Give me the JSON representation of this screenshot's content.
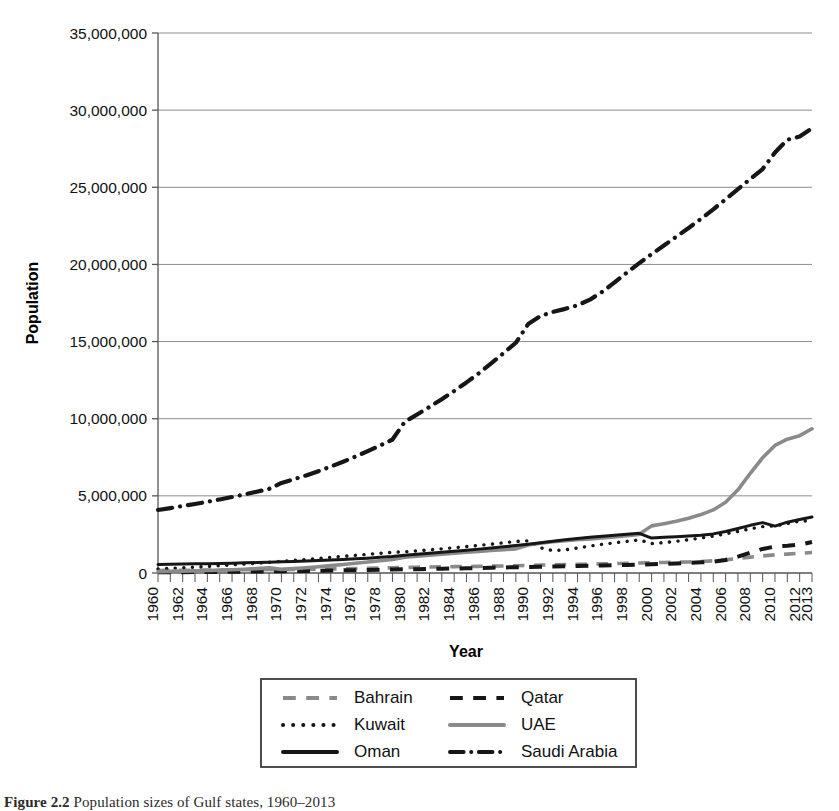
{
  "figure": {
    "caption_prefix": "Figure 2.2",
    "caption_text": "Population sizes of Gulf states, 1960–2013"
  },
  "axes": {
    "y_title": "Population",
    "x_title": "Year",
    "y_ticks": [
      "0",
      "5,000,000",
      "10,000,000",
      "15,000,000",
      "20,000,000",
      "25,000,000",
      "30,000,000",
      "35,000,000"
    ],
    "x_ticks": [
      "1960",
      "1962",
      "1964",
      "1966",
      "1968",
      "1970",
      "1972",
      "1974",
      "1976",
      "1978",
      "1980",
      "1982",
      "1984",
      "1986",
      "1988",
      "1990",
      "1992",
      "1994",
      "1996",
      "1998",
      "2000",
      "2002",
      "2004",
      "2006",
      "2008",
      "2010",
      "2012",
      "2013"
    ]
  },
  "legend": {
    "entries": [
      {
        "label": "Bahrain",
        "style": "dashed",
        "color": "#8a8a8a",
        "col": 0,
        "row": 0
      },
      {
        "label": "Qatar",
        "style": "dashed",
        "color": "#161616",
        "col": 1,
        "row": 0
      },
      {
        "label": "Kuwait",
        "style": "dotted",
        "color": "#161616",
        "col": 0,
        "row": 1
      },
      {
        "label": "UAE",
        "style": "solid",
        "color": "#8a8a8a",
        "col": 1,
        "row": 1
      },
      {
        "label": "Oman",
        "style": "solid",
        "color": "#161616",
        "col": 0,
        "row": 2
      },
      {
        "label": "Saudi Arabia",
        "style": "dashdot",
        "color": "#161616",
        "col": 1,
        "row": 2
      }
    ]
  },
  "chart_data": {
    "type": "line",
    "title": "",
    "xlabel": "Year",
    "ylabel": "Population",
    "xlim": [
      1960,
      2013
    ],
    "ylim": [
      0,
      35000000
    ],
    "grid": true,
    "legend_position": "bottom",
    "x": [
      1960,
      1961,
      1962,
      1963,
      1964,
      1965,
      1966,
      1967,
      1968,
      1969,
      1970,
      1971,
      1972,
      1973,
      1974,
      1975,
      1976,
      1977,
      1978,
      1979,
      1980,
      1981,
      1982,
      1983,
      1984,
      1985,
      1986,
      1987,
      1988,
      1989,
      1990,
      1991,
      1992,
      1993,
      1994,
      1995,
      1996,
      1997,
      1998,
      1999,
      2000,
      2001,
      2002,
      2003,
      2004,
      2005,
      2006,
      2007,
      2008,
      2009,
      2010,
      2011,
      2012,
      2013
    ],
    "series": [
      {
        "name": "Bahrain",
        "style": "dashed",
        "color": "#8a8a8a",
        "values": [
          162000,
          168000,
          174000,
          181000,
          187000,
          194000,
          201000,
          208000,
          215000,
          222000,
          220000,
          228000,
          238000,
          250000,
          263000,
          277000,
          292000,
          307000,
          322000,
          337000,
          358000,
          375000,
          390000,
          402000,
          412000,
          422000,
          432000,
          444000,
          457000,
          471000,
          493000,
          514000,
          530000,
          544000,
          558000,
          574000,
          592000,
          611000,
          630000,
          650000,
          666000,
          682000,
          699000,
          716000,
          744000,
          788000,
          853000,
          937000,
          1030000,
          1106000,
          1175000,
          1226000,
          1277000,
          1332000
        ]
      },
      {
        "name": "Qatar",
        "style": "dashed",
        "color": "#161616",
        "values": [
          47000,
          51000,
          56000,
          61000,
          67000,
          74000,
          82000,
          90000,
          98000,
          106000,
          112000,
          119000,
          129000,
          142000,
          156000,
          170000,
          184000,
          198000,
          212000,
          226000,
          238000,
          249000,
          262000,
          276000,
          292000,
          308000,
          325000,
          343000,
          361000,
          377000,
          391000,
          404000,
          418000,
          433000,
          449000,
          466000,
          483000,
          502000,
          522000,
          543000,
          566000,
          592000,
          622000,
          655000,
          691000,
          736000,
          846000,
          1065000,
          1314000,
          1560000,
          1715000,
          1765000,
          1833000,
          2004000
        ]
      },
      {
        "name": "Kuwait",
        "style": "dotted",
        "color": "#161616",
        "values": [
          269000,
          302000,
          339000,
          381000,
          427000,
          477000,
          529000,
          583000,
          639000,
          697000,
          756000,
          817000,
          880000,
          946000,
          1013000,
          1080000,
          1146000,
          1212000,
          1277000,
          1340000,
          1377000,
          1436000,
          1502000,
          1570000,
          1640000,
          1712000,
          1788000,
          1869000,
          1956000,
          2047000,
          2088000,
          1631000,
          1451000,
          1503000,
          1621000,
          1745000,
          1859000,
          1959000,
          2051000,
          2144000,
          1906000,
          1972000,
          2052000,
          2154000,
          2264000,
          2394000,
          2538000,
          2698000,
          2860000,
          3006000,
          3051000,
          3201000,
          3368000,
          3369000
        ]
      },
      {
        "name": "UAE",
        "style": "solid",
        "color": "#8a8a8a",
        "values": [
          92000,
          105000,
          120000,
          138000,
          159000,
          184000,
          213000,
          246000,
          286000,
          331000,
          235000,
          285000,
          342000,
          406000,
          477000,
          548000,
          629000,
          712000,
          795000,
          878000,
          1016000,
          1089000,
          1159000,
          1224000,
          1283000,
          1342000,
          1399000,
          1454000,
          1508000,
          1562000,
          1809000,
          1930000,
          2023000,
          2094000,
          2155000,
          2213000,
          2275000,
          2343000,
          2419000,
          2506000,
          3055000,
          3195000,
          3355000,
          3549000,
          3785000,
          4089000,
          4588000,
          5390000,
          6464000,
          7472000,
          8270000,
          8672000,
          8900000,
          9346000
        ]
      },
      {
        "name": "Oman",
        "style": "solid",
        "color": "#161616",
        "values": [
          551000,
          564000,
          578000,
          592000,
          607000,
          623000,
          639000,
          657000,
          676000,
          696000,
          724000,
          748000,
          774000,
          803000,
          836000,
          874000,
          917000,
          964000,
          1013000,
          1063000,
          1154000,
          1216000,
          1280000,
          1345000,
          1410000,
          1477000,
          1547000,
          1620000,
          1697000,
          1777000,
          1868000,
          1962000,
          2058000,
          2152000,
          2239000,
          2318000,
          2389000,
          2453000,
          2513000,
          2572000,
          2264000,
          2310000,
          2356000,
          2402000,
          2450000,
          2534000,
          2690000,
          2886000,
          3090000,
          3266000,
          3041000,
          3295000,
          3463000,
          3632000
        ]
      },
      {
        "name": "Saudi Arabia",
        "style": "dashdot",
        "color": "#161616",
        "values": [
          4086000,
          4209000,
          4338000,
          4474000,
          4617000,
          4767000,
          4925000,
          5091000,
          5266000,
          5452000,
          5836000,
          6071000,
          6325000,
          6600000,
          6895000,
          7211000,
          7545000,
          7896000,
          8264000,
          8652000,
          9801000,
          10275000,
          10762000,
          11266000,
          11793000,
          12351000,
          12947000,
          13583000,
          14250000,
          14924000,
          16135000,
          16656000,
          16922000,
          17121000,
          17354000,
          17715000,
          18221000,
          18832000,
          19474000,
          20080000,
          20663000,
          21231000,
          21794000,
          22363000,
          22952000,
          23574000,
          24222000,
          24882000,
          25540000,
          26182000,
          27258000,
          28082000,
          28288000,
          28829000
        ]
      }
    ]
  }
}
